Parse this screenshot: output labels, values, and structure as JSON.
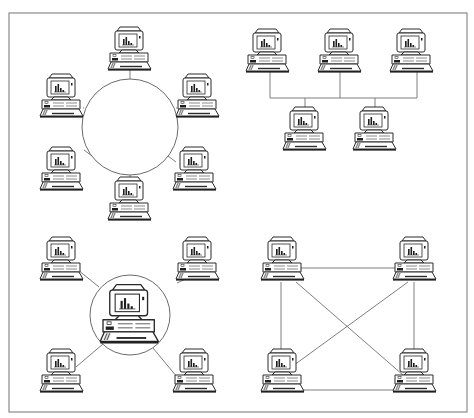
{
  "figure": {
    "frame": {
      "x": 9,
      "y": 13,
      "width": 458,
      "height": 399,
      "stroke": "#8a8a8a"
    },
    "colors": {
      "background": "#ffffff",
      "line": "#6f6f6f",
      "ink": "#2a2a2a"
    }
  },
  "topologies": [
    {
      "id": "ring",
      "name": "Ring topology",
      "ring": {
        "cx": 130,
        "cy": 127,
        "r": 48
      },
      "nodes": [
        {
          "x": 130,
          "y": 48,
          "icon": "desktop-computer-icon"
        },
        {
          "x": 62,
          "y": 95,
          "icon": "desktop-computer-icon"
        },
        {
          "x": 198,
          "y": 95,
          "icon": "desktop-computer-icon"
        },
        {
          "x": 62,
          "y": 168,
          "icon": "desktop-computer-icon"
        },
        {
          "x": 195,
          "y": 168,
          "icon": "desktop-computer-icon"
        },
        {
          "x": 130,
          "y": 198,
          "icon": "desktop-computer-icon"
        }
      ],
      "links": [
        [
          130,
          68,
          130,
          79
        ],
        [
          83,
          108,
          84,
          108
        ],
        [
          176,
          108,
          177,
          108
        ],
        [
          84,
          150,
          92,
          156
        ],
        [
          168,
          156,
          176,
          162
        ],
        [
          130,
          175,
          130,
          181
        ]
      ]
    },
    {
      "id": "bus",
      "name": "Bus topology",
      "nodes": [
        {
          "x": 268,
          "y": 50,
          "icon": "desktop-computer-icon"
        },
        {
          "x": 340,
          "y": 50,
          "icon": "desktop-computer-icon"
        },
        {
          "x": 412,
          "y": 50,
          "icon": "desktop-computer-icon"
        },
        {
          "x": 305,
          "y": 128,
          "icon": "desktop-computer-icon"
        },
        {
          "x": 375,
          "y": 128,
          "icon": "desktop-computer-icon"
        }
      ],
      "links": [
        [
          270,
          98,
          417,
          98
        ],
        [
          270,
          72,
          270,
          98
        ],
        [
          340,
          72,
          340,
          98
        ],
        [
          417,
          72,
          417,
          98
        ],
        [
          305,
          98,
          305,
          108
        ],
        [
          375,
          98,
          375,
          108
        ]
      ]
    },
    {
      "id": "star",
      "name": "Star topology",
      "hub": {
        "cx": 130,
        "cy": 315,
        "r": 40,
        "node": {
          "x": 130,
          "y": 313,
          "scale": 1.35,
          "icon": "server-computer-icon"
        }
      },
      "nodes": [
        {
          "x": 62,
          "y": 258,
          "icon": "desktop-computer-icon"
        },
        {
          "x": 198,
          "y": 258,
          "icon": "desktop-computer-icon"
        },
        {
          "x": 62,
          "y": 370,
          "icon": "desktop-computer-icon"
        },
        {
          "x": 195,
          "y": 370,
          "icon": "desktop-computer-icon"
        }
      ],
      "links": [
        [
          78,
          270,
          99,
          287
        ],
        [
          177,
          283,
          196,
          274
        ],
        [
          76,
          367,
          103,
          344
        ],
        [
          153,
          348,
          177,
          377
        ]
      ]
    },
    {
      "id": "mesh",
      "name": "Mesh topology",
      "nodes": [
        {
          "x": 283,
          "y": 258,
          "icon": "desktop-computer-icon"
        },
        {
          "x": 415,
          "y": 258,
          "icon": "desktop-computer-icon"
        },
        {
          "x": 283,
          "y": 370,
          "icon": "desktop-computer-icon"
        },
        {
          "x": 415,
          "y": 370,
          "icon": "desktop-computer-icon"
        }
      ],
      "links": [
        [
          298,
          268,
          400,
          268
        ],
        [
          298,
          390,
          400,
          390
        ],
        [
          281,
          282,
          281,
          359
        ],
        [
          414,
          282,
          414,
          358
        ],
        [
          296,
          282,
          403,
          375
        ],
        [
          408,
          282,
          290,
          368
        ]
      ]
    }
  ]
}
